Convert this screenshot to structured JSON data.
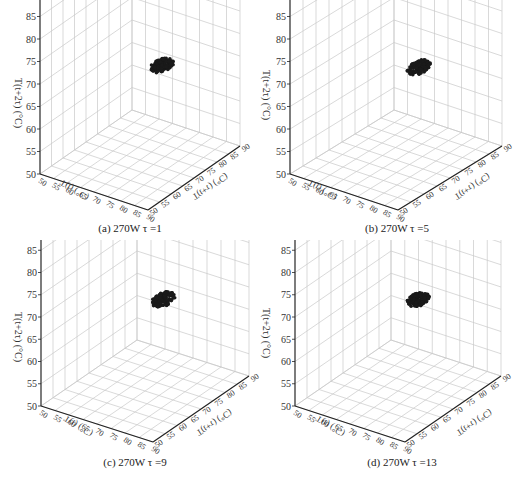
{
  "chart_data": [
    {
      "type": "scatter",
      "dimension": "3d",
      "title": "(a) 270W τ =1",
      "xlabel": "T(t) (°C)",
      "ylabel": "T(t+τ) (°C)",
      "zlabel": "T(t+2τ) (°C)",
      "xlim": [
        50,
        90
      ],
      "ylim": [
        50,
        90
      ],
      "zlim": [
        50,
        90
      ],
      "ticks": [
        50,
        55,
        60,
        65,
        70,
        75,
        80,
        85,
        90
      ],
      "grid": true,
      "cluster": {
        "x_center": 72,
        "y_center": 72,
        "z_center": 72.5,
        "spread": 2
      }
    },
    {
      "type": "scatter",
      "dimension": "3d",
      "title": "(b) 270W τ =5",
      "xlabel": "T(t) (°C)",
      "ylabel": "T(t+τ) (°C)",
      "zlabel": "T(t+2τ) (°C)",
      "xlim": [
        50,
        90
      ],
      "ylim": [
        50,
        90
      ],
      "zlim": [
        50,
        90
      ],
      "ticks": [
        50,
        55,
        60,
        65,
        70,
        75,
        80,
        85,
        90
      ],
      "grid": true,
      "cluster": {
        "x_center": 72,
        "y_center": 72,
        "z_center": 72.5,
        "spread": 2
      }
    },
    {
      "type": "scatter",
      "dimension": "3d",
      "title": "(c) 270W τ =9",
      "xlabel": "T(t) (°C)",
      "ylabel": "T(t+τ) (°C)",
      "zlabel": "T(t+2τ) (°C)",
      "xlim": [
        50,
        90
      ],
      "ylim": [
        50,
        90
      ],
      "zlim": [
        50,
        90
      ],
      "ticks": [
        50,
        55,
        60,
        65,
        70,
        75,
        80,
        85,
        90
      ],
      "grid": true,
      "cluster": {
        "x_center": 72,
        "y_center": 72,
        "z_center": 72.5,
        "spread": 2
      }
    },
    {
      "type": "scatter",
      "dimension": "3d",
      "title": "(d) 270W τ =13",
      "xlabel": "T(t) (°C)",
      "ylabel": "T(t+τ) (°C)",
      "zlabel": "T(t+2τ) (°C)",
      "xlim": [
        50,
        90
      ],
      "ylim": [
        50,
        90
      ],
      "zlim": [
        50,
        90
      ],
      "ticks": [
        50,
        55,
        60,
        65,
        70,
        75,
        80,
        85,
        90
      ],
      "grid": true,
      "cluster": {
        "x_center": 72,
        "y_center": 72,
        "z_center": 72.5,
        "spread": 2
      }
    }
  ],
  "panels": [
    {
      "caption": "(a) 270W τ =1",
      "zlabel": "T(t+2τ) (°C)",
      "xlabel": "T(t) (°C)",
      "ylabel": "T(t+τ) (°C)"
    },
    {
      "caption": "(b) 270W τ =5",
      "zlabel": "T(t+2τ) (°C)",
      "xlabel": "T(t) (°C)",
      "ylabel": "T(t+τ) (°C)"
    },
    {
      "caption": "(c) 270W τ =9",
      "zlabel": "T(t+2τ) (°C)",
      "xlabel": "T(t) (°C)",
      "ylabel": "T(t+τ) (°C)"
    },
    {
      "caption": "(d) 270W τ =13",
      "zlabel": "T(t+2τ) (°C)",
      "xlabel": "T(t) (°C)",
      "ylabel": "T(t+τ) (°C)"
    }
  ],
  "tick_labels": [
    "50",
    "55",
    "60",
    "65",
    "70",
    "75",
    "80",
    "85",
    "90"
  ],
  "colors": {
    "grid": "#c8c8c8",
    "axis": "#222222",
    "points": "#1a1a1a"
  }
}
